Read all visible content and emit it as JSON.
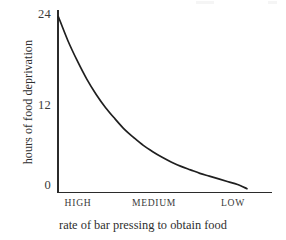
{
  "chart_data": {
    "type": "line",
    "title": "",
    "subtitle": "",
    "xlabel": "rate of bar pressing to obtain food",
    "ylabel": "hours of food deprivation",
    "categories": [
      "HIGH",
      "MEDIUM",
      "LOW"
    ],
    "xtick_labels": [
      "HIGH",
      "MEDIUM",
      "LOW"
    ],
    "ytick_labels": [
      "24",
      "12",
      "0"
    ],
    "ytick_values": [
      24,
      12,
      0
    ],
    "ylim": [
      0,
      26
    ],
    "grid": false,
    "legend": false,
    "legend_position": "none",
    "series": [
      {
        "name": "food deprivation vs bar pressing rate",
        "x": [
          0,
          5,
          10,
          15,
          20,
          25,
          30,
          35,
          40,
          45,
          50,
          55,
          60,
          65,
          70,
          75,
          80,
          85,
          90,
          95,
          100
        ],
        "values": [
          25.0,
          21.6,
          18.7,
          16.1,
          13.9,
          12.0,
          10.4,
          8.9,
          7.7,
          6.6,
          5.7,
          4.9,
          4.2,
          3.6,
          3.1,
          2.6,
          2.2,
          1.8,
          1.4,
          1.0,
          0.4
        ]
      }
    ],
    "annotations": []
  },
  "axis": {
    "y_label": "hours of food deprivation",
    "x_label": "rate of bar pressing to obtain food",
    "y_ticks": [
      {
        "label": "24",
        "top_px": 8
      },
      {
        "label": "12",
        "top_px": 99
      },
      {
        "label": "0",
        "top_px": 179
      }
    ],
    "x_ticks": [
      {
        "label": "HIGH",
        "left_px": 60,
        "width_px": 36
      },
      {
        "label": "MEDIUM",
        "left_px": 128,
        "width_px": 52
      },
      {
        "label": "LOW",
        "left_px": 214,
        "width_px": 38
      }
    ]
  },
  "style": {
    "ink_color": "#2b2b2b",
    "text_color": "#2e2e2e",
    "tick_text_color": "#3a3a3a",
    "background_color": "#ffffff",
    "curve_color": "#1f1f1f"
  }
}
